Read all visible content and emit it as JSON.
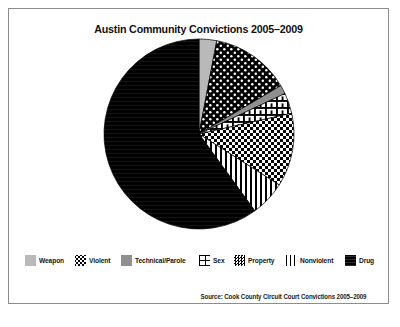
{
  "figure": {
    "title": "Austin Community Convictions 2005–2009",
    "source_note": "Source: Cook County Circuit Court Convictions 2005–2009",
    "frame_color": "#8d8d8d",
    "background": "#ffffff"
  },
  "chart_data": {
    "type": "pie",
    "title": "Austin Community Convictions 2005–2009",
    "xlabel": "",
    "ylabel": "",
    "grid": false,
    "legend_position": "bottom",
    "start_angle_deg": 0,
    "direction": "clockwise",
    "categories": [
      "Weapon",
      "Violent",
      "Technical/Parole",
      "Sex",
      "Property",
      "Nonviolent",
      "Drug"
    ],
    "values": [
      3.0,
      13.5,
      1.5,
      3.5,
      12.5,
      6.0,
      60.0
    ],
    "slices": [
      {
        "label": "Weapon",
        "value": 3.0,
        "fill": "#b9b9b9",
        "pattern": "solid-light-gray",
        "start_deg": 0.0,
        "end_deg": 10.8
      },
      {
        "label": "Violent",
        "value": 13.5,
        "fill": "#000000",
        "pattern": "black-white-dots",
        "start_deg": 10.8,
        "end_deg": 59.4
      },
      {
        "label": "Technical/Parole",
        "value": 1.5,
        "fill": "#8f8f8f",
        "pattern": "solid-mid-gray",
        "start_deg": 59.4,
        "end_deg": 64.8
      },
      {
        "label": "Sex",
        "value": 3.5,
        "fill": "#ffffff",
        "pattern": "brick-grid",
        "start_deg": 64.8,
        "end_deg": 77.4
      },
      {
        "label": "Property",
        "value": 12.5,
        "fill": "#000000",
        "pattern": "checkerboard",
        "start_deg": 77.4,
        "end_deg": 122.4
      },
      {
        "label": "Nonviolent",
        "value": 6.0,
        "fill": "#ffffff",
        "pattern": "vertical-lines",
        "start_deg": 122.4,
        "end_deg": 144.0
      },
      {
        "label": "Drug",
        "value": 60.0,
        "fill": "#000000",
        "pattern": "solid-black",
        "start_deg": 144.0,
        "end_deg": 360.0
      }
    ]
  },
  "legend": {
    "items": [
      {
        "label": "Weapon",
        "swatch": "weapon-swatch"
      },
      {
        "label": "Violent",
        "swatch": "violent-swatch"
      },
      {
        "label": "Technical/Parole",
        "swatch": "technical-parole-swatch"
      },
      {
        "label": "Sex",
        "swatch": "sex-swatch"
      },
      {
        "label": "Property",
        "swatch": "property-swatch"
      },
      {
        "label": "Nonviolent",
        "swatch": "nonviolent-swatch"
      },
      {
        "label": "Drug",
        "swatch": "drug-swatch"
      }
    ]
  }
}
